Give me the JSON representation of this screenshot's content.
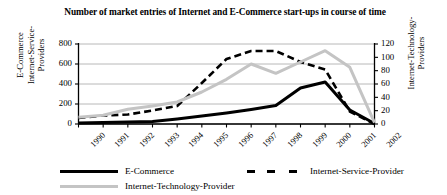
{
  "title": "Number of market entries of Internet and E-Commerce start-ups in course of time",
  "axes": {
    "left_label": "E-Commerce\nInternet-Service-\nProviders",
    "right_label": "Internet-Technology-\nProviders",
    "left_ticks": [
      "800",
      "600",
      "400",
      "200",
      "0"
    ],
    "right_ticks": [
      "120",
      "100",
      "80",
      "60",
      "40",
      "20",
      "0"
    ]
  },
  "legend": {
    "items": [
      {
        "label": "E-Commerce",
        "color": "#000000",
        "style": "solid"
      },
      {
        "label": "Internet-Service-Provider",
        "color": "#000000",
        "style": "dashed"
      },
      {
        "label": "Internet-Technology-Provider",
        "color": "#c4c4c4",
        "style": "solid"
      }
    ]
  },
  "colors": {
    "ecommerce": "#000000",
    "isp": "#000000",
    "itp": "#c4c4c4",
    "grid": "#a6a6a6",
    "axis": "#000000"
  },
  "chart_data": {
    "type": "line",
    "title": "Number of market entries of Internet and E-Commerce start-ups in course of time",
    "xlabel": "",
    "ylabel": "E-Commerce Internet-Service-Providers",
    "y2label": "Internet-Technology-Providers",
    "categories": [
      "1990",
      "1991",
      "1992",
      "1993",
      "1994",
      "1995",
      "1996",
      "1997",
      "1998",
      "1999",
      "2000",
      "2001",
      "2002"
    ],
    "ylim": [
      0,
      800
    ],
    "y2lim": [
      0,
      120
    ],
    "yticks": [
      0,
      200,
      400,
      600,
      800
    ],
    "y2ticks": [
      0,
      20,
      40,
      60,
      80,
      100,
      120
    ],
    "grid": true,
    "legend_position": "bottom",
    "series": [
      {
        "name": "E-Commerce",
        "axis": "left",
        "color": "#000000",
        "style": "solid",
        "values": [
          10,
          15,
          20,
          25,
          50,
          80,
          110,
          145,
          185,
          360,
          420,
          140,
          5
        ]
      },
      {
        "name": "Internet-Service-Provider",
        "axis": "left",
        "color": "#000000",
        "style": "dashed",
        "values": [
          60,
          85,
          95,
          135,
          180,
          410,
          650,
          730,
          730,
          620,
          545,
          125,
          0
        ]
      },
      {
        "name": "Internet-Technology-Provider",
        "axis": "right",
        "color": "#c4c4c4",
        "style": "solid",
        "values": [
          10,
          13,
          22,
          27,
          33,
          48,
          67,
          90,
          76,
          93,
          110,
          85,
          2
        ]
      }
    ]
  }
}
